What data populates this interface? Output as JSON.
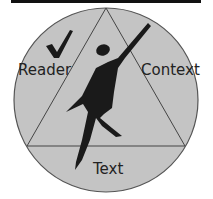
{
  "diagram": {
    "labels": {
      "reader": "Reader",
      "context": "Context",
      "text": "Text"
    },
    "icons": {
      "checkmark": "checkmark-icon",
      "figure": "human-figure-icon"
    },
    "colors": {
      "circle_fill": "#c4c4c4",
      "stroke": "#444444",
      "figure": "#1a1a1a",
      "top_bar": "#111111"
    }
  }
}
